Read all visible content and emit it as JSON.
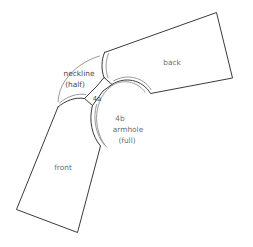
{
  "diagram": {
    "background_color": "#ffffff",
    "outline_color": "#3a3a3a",
    "seam_allowance_color": "#8d8d8d",
    "label_color": "#6f6f6f"
  },
  "labels": {
    "back": "back",
    "front": "front",
    "neckline_line1": "neckline",
    "neckline_line2": "(half)",
    "marker_4a": "4a",
    "marker_4b": "4b",
    "armhole_line1": "armhole",
    "armhole_line2": "(full)"
  }
}
